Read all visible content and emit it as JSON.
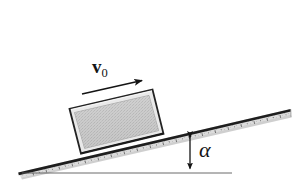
{
  "figure": {
    "width": 301,
    "height": 190,
    "background_color": "#ffffff"
  },
  "labels": {
    "velocity": {
      "symbol": "v",
      "subscript": "0",
      "full": "v0",
      "description": "initial velocity vector label"
    },
    "angle": {
      "symbol": "α",
      "description": "incline angle label"
    }
  },
  "colors": {
    "outline": "#141414",
    "ruler_body": "#d8d8d8",
    "ruler_edge": "#1c1c1c",
    "block_fill": "#c9c9c9",
    "block_border_band": "#e6e6e6",
    "block_outline": "#2a2a2a",
    "baseline": "#4a4a4a",
    "arrow": "#1a1a1a"
  },
  "geometry": {
    "incline_angle_degrees": 13,
    "ruler": {
      "left_tip": [
        18,
        172
      ],
      "right_tip": [
        291,
        109
      ],
      "thickness": 9
    },
    "baseline": {
      "start": [
        22,
        173
      ],
      "end": [
        231,
        173
      ]
    },
    "angle_arrow": {
      "x": 190,
      "top_y": 133,
      "bottom_y": 172,
      "double_headed": true
    },
    "velocity_arrow": {
      "start": [
        83,
        93
      ],
      "end": [
        146,
        79
      ]
    },
    "block": {
      "corners": [
        [
          70,
          108
        ],
        [
          152,
          90
        ],
        [
          163,
          134
        ],
        [
          82,
          153
        ]
      ]
    }
  },
  "elements": {
    "ruler_name": "inclined-plane-ruler",
    "block_name": "sliding-block",
    "velocity_arrow_name": "velocity-arrow",
    "angle_arrow_name": "angle-height-arrow",
    "baseline_name": "horizontal-baseline"
  }
}
